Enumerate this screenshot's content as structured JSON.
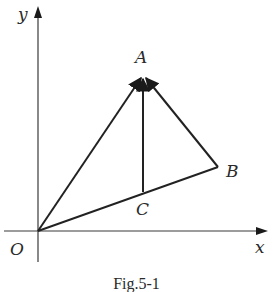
{
  "figure": {
    "caption": "Fig.5-1",
    "axes": {
      "x_label": "x",
      "y_label": "y",
      "origin_label": "O"
    },
    "points": {
      "O": {
        "label": "O"
      },
      "A": {
        "label": "A"
      },
      "B": {
        "label": "B"
      },
      "C": {
        "label": "C"
      }
    },
    "segments": [
      {
        "from": "O",
        "to": "A",
        "type": "vector"
      },
      {
        "from": "C",
        "to": "A",
        "type": "vector"
      },
      {
        "from": "B",
        "to": "A",
        "type": "vector"
      },
      {
        "from": "O",
        "to": "B",
        "type": "segment"
      }
    ],
    "colors": {
      "line": "#2a2a2a",
      "background": "#ffffff"
    }
  }
}
